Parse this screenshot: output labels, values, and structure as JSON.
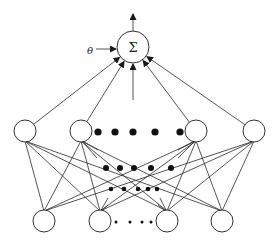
{
  "diagram": {
    "type": "neural-network",
    "summation_node": {
      "label": "Σ",
      "cx": 133,
      "cy": 47,
      "r": 16
    },
    "bias": {
      "label": "θ",
      "x": 90,
      "y": 52
    },
    "output_arrow": {
      "x": 133,
      "y_from": 31,
      "y_to": 14
    },
    "center_input_arrow": {
      "x": 133,
      "y_from": 100,
      "y_to": 64
    },
    "hidden_layer": [
      {
        "id": "h1",
        "cx": 25,
        "cy": 131
      },
      {
        "id": "h2",
        "cx": 81,
        "cy": 131
      },
      {
        "id": "h3",
        "cx": 196,
        "cy": 131
      },
      {
        "id": "h4",
        "cx": 254,
        "cy": 131
      }
    ],
    "input_layer": [
      {
        "id": "i1",
        "cx": 44,
        "cy": 221
      },
      {
        "id": "i2",
        "cx": 100,
        "cy": 221
      },
      {
        "id": "i3",
        "cx": 167,
        "cy": 221
      },
      {
        "id": "i4",
        "cx": 222,
        "cy": 221
      }
    ],
    "node_radius": 11,
    "ellipsis_rows": [
      {
        "y": 132,
        "r": 3.6,
        "xs": [
          98,
          115,
          133,
          155,
          180
        ]
      },
      {
        "y": 168,
        "r": 3.0,
        "xs": [
          106,
          120,
          134,
          151,
          171
        ]
      },
      {
        "y": 189,
        "r": 2.3,
        "xs": [
          111,
          124,
          138,
          148,
          157
        ]
      },
      {
        "y": 222,
        "r": 1.5,
        "xs": [
          116,
          130,
          142,
          151
        ]
      }
    ],
    "colors": {
      "stroke": "#2a2a2a",
      "dot": "#111111",
      "background": "#ffffff"
    }
  }
}
